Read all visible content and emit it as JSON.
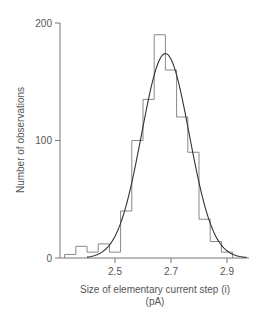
{
  "chart_data": {
    "type": "bar",
    "subtype": "histogram_with_fitted_curve",
    "title": "",
    "xlabel": "Size of elementary current step (i)",
    "xlabel_units": "(pA)",
    "ylabel": "Number of observations",
    "xlim": [
      2.32,
      2.98
    ],
    "ylim": [
      0,
      200
    ],
    "x_ticks": [
      2.5,
      2.7,
      2.9
    ],
    "x_tick_labels": [
      "2.5",
      "2.7",
      "2.9"
    ],
    "y_ticks": [
      0,
      100,
      200
    ],
    "y_tick_labels": [
      "0",
      "100",
      "200"
    ],
    "grid": false,
    "legend": null,
    "bin_width": 0.04,
    "bin_edges": [
      2.32,
      2.36,
      2.4,
      2.44,
      2.48,
      2.52,
      2.56,
      2.6,
      2.64,
      2.68,
      2.72,
      2.76,
      2.8,
      2.84,
      2.88,
      2.92
    ],
    "categories": [
      "2.32-2.36",
      "2.36-2.40",
      "2.40-2.44",
      "2.44-2.48",
      "2.48-2.52",
      "2.52-2.56",
      "2.56-2.60",
      "2.60-2.64",
      "2.64-2.68",
      "2.68-2.72",
      "2.72-2.76",
      "2.76-2.80",
      "2.80-2.84",
      "2.84-2.88",
      "2.88-2.92"
    ],
    "values": [
      3,
      10,
      5,
      12,
      5,
      40,
      100,
      135,
      190,
      160,
      120,
      90,
      33,
      14,
      5
    ],
    "fitted_curve": {
      "type": "gaussian",
      "mean": 2.68,
      "peak": 174,
      "sd": 0.085,
      "x_range": [
        2.4,
        2.97
      ]
    }
  }
}
